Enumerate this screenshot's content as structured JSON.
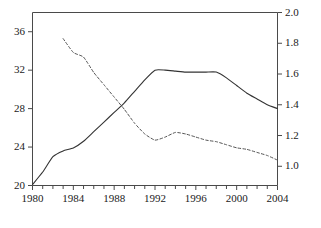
{
  "chart_data": {
    "type": "line",
    "title": "",
    "subtitle": "",
    "xlabel": "",
    "ylabel": "",
    "xlim": [
      1980,
      2004
    ],
    "grid": false,
    "legend": "none",
    "axes": {
      "x": {
        "label": "",
        "range": [
          1980,
          2004
        ],
        "tick_labels": [
          "1980",
          "1984",
          "1988",
          "1992",
          "1996",
          "2000",
          "2004"
        ],
        "tick_values": [
          1980,
          1984,
          1988,
          1992,
          1996,
          2000,
          2004
        ],
        "minor_tick_interval": 1
      },
      "y_left": {
        "label": "",
        "range": [
          20,
          38
        ],
        "tick_labels": [
          "20",
          "24",
          "28",
          "32",
          "36"
        ],
        "tick_values": [
          20,
          24,
          28,
          32,
          36
        ]
      },
      "y_right": {
        "label": "",
        "range": [
          0.875,
          2.0
        ],
        "tick_labels": [
          "1.0",
          "1.2",
          "1.4",
          "1.6",
          "1.8",
          "2.0"
        ],
        "tick_values": [
          1.0,
          1.2,
          1.4,
          1.6,
          1.8,
          2.0
        ]
      }
    },
    "series": [
      {
        "name": "solid-series",
        "axis": "y_left",
        "style": "solid",
        "color": "#333333",
        "x": [
          1980,
          1981,
          1982,
          1983,
          1984,
          1985,
          1986,
          1987,
          1988,
          1989,
          1990,
          1991,
          1992,
          1993,
          1994,
          1995,
          1996,
          1997,
          1998,
          1999,
          2000,
          2001,
          2002,
          2003,
          2004
        ],
        "values": [
          20.1,
          21.4,
          23.0,
          23.6,
          23.9,
          24.6,
          25.6,
          26.6,
          27.6,
          28.6,
          29.8,
          31.0,
          32.0,
          32.0,
          31.9,
          31.8,
          31.8,
          31.8,
          31.8,
          31.2,
          30.4,
          29.6,
          29.0,
          28.4,
          28.0
        ]
      },
      {
        "name": "dashed-series",
        "axis": "y_right",
        "style": "dashed",
        "color": "#555555",
        "x": [
          1983,
          1984,
          1985,
          1986,
          1987,
          1988,
          1989,
          1990,
          1991,
          1992,
          1993,
          1994,
          1995,
          1996,
          1997,
          1998,
          1999,
          2000,
          2001,
          2002,
          2003,
          2004
        ],
        "values": [
          1.83,
          1.74,
          1.71,
          1.61,
          1.53,
          1.45,
          1.37,
          1.28,
          1.21,
          1.17,
          1.19,
          1.22,
          1.21,
          1.19,
          1.17,
          1.16,
          1.14,
          1.12,
          1.11,
          1.09,
          1.07,
          1.04
        ]
      }
    ]
  }
}
